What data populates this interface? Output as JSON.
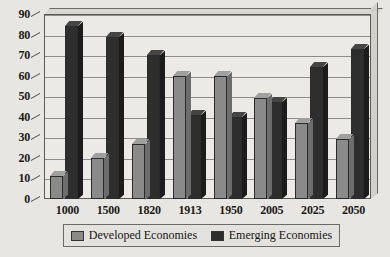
{
  "chart_data": {
    "type": "bar",
    "title": "",
    "xlabel": "",
    "ylabel": "",
    "ylim": [
      0,
      90
    ],
    "ytick_step": 10,
    "grid": true,
    "legend_position": "bottom",
    "categories": [
      "1000",
      "1500",
      "1820",
      "1913",
      "1950",
      "2005",
      "2025",
      "2050"
    ],
    "yticks": [
      "0",
      "10",
      "20",
      "30",
      "40",
      "50",
      "60",
      "70",
      "80",
      "90"
    ],
    "series": [
      {
        "name": "Developed Economies",
        "color": "#8a8a8a",
        "values": [
          11,
          20,
          27,
          60,
          60,
          49,
          37,
          29
        ]
      },
      {
        "name": "Emerging Economies",
        "color": "#2e2e2e",
        "values": [
          84,
          79,
          70,
          41,
          40,
          47,
          64,
          73
        ]
      }
    ]
  },
  "legend": {
    "items": [
      {
        "label": "Developed Economies",
        "swatch": "legend-swatch-developed"
      },
      {
        "label": "Emerging Economies",
        "swatch": "legend-swatch-emerging"
      }
    ]
  }
}
